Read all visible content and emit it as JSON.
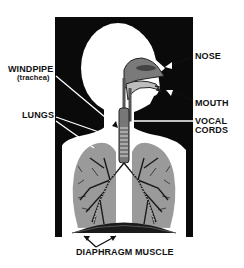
{
  "diagram": {
    "labels": {
      "nose": "NOSE",
      "mouth": "MOUTH",
      "vocal_cords_line1": "VOCAL",
      "vocal_cords_line2": "CORDS",
      "windpipe": "WINDPIPE",
      "windpipe_sub": "(trachea)",
      "lungs": "LUNGS",
      "diaphragm": "DIAPHRAGM MUSCLE"
    },
    "colors": {
      "panel": "#0a0a0a",
      "body": "#ffffff",
      "lung": "#9a9a9a",
      "airway": "#6e6e6e",
      "text": "#111111"
    }
  }
}
